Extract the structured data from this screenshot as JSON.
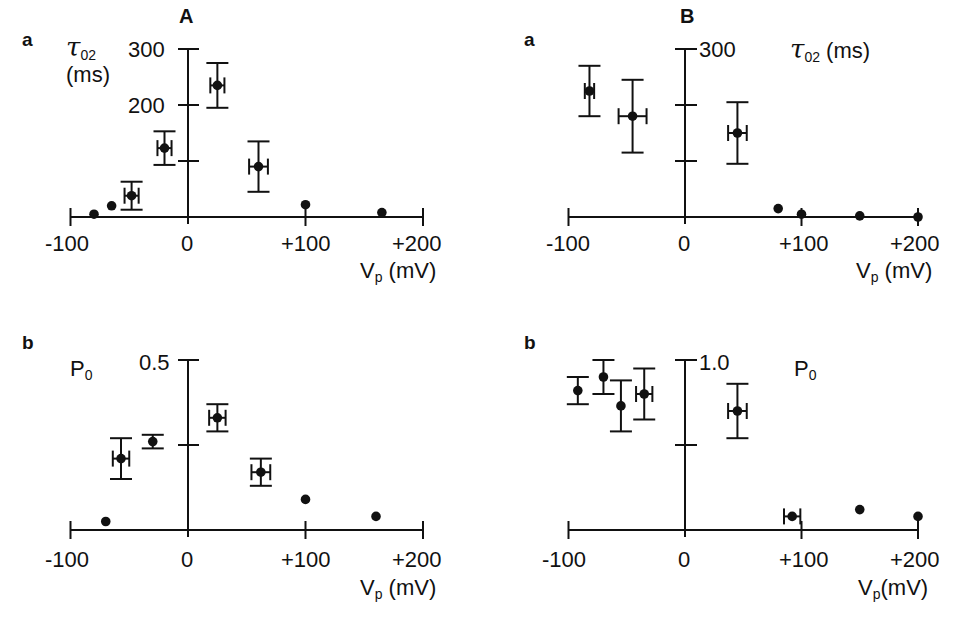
{
  "figure": {
    "panels": [
      "A",
      "B"
    ],
    "subpanels": [
      "a",
      "b"
    ]
  },
  "chart_data": [
    {
      "id": "A-a",
      "panel": "A",
      "subpanel": "a",
      "type": "scatter",
      "title": "A",
      "xlabel": "Vp (mV)",
      "ylabel": "τ02 (ms)",
      "xlim": [
        -100,
        200
      ],
      "ylim": [
        0,
        300
      ],
      "xticks": [
        "-100",
        "0",
        "+100",
        "+200"
      ],
      "yticks": [
        "100",
        "200",
        "300"
      ],
      "ytick_labels_shown": [
        "200",
        "300"
      ],
      "grid": false,
      "points": [
        {
          "x": -80,
          "y": 5
        },
        {
          "x": -65,
          "y": 20
        },
        {
          "x": -48,
          "y": 38,
          "yerr": 25,
          "xerr": 6
        },
        {
          "x": -20,
          "y": 123,
          "yerr": 30,
          "xerr": 6
        },
        {
          "x": 25,
          "y": 235,
          "yerr": 40,
          "xerr": 6
        },
        {
          "x": 60,
          "y": 90,
          "yerr": 45,
          "xerr": 8
        },
        {
          "x": 100,
          "y": 22
        },
        {
          "x": 165,
          "y": 8
        }
      ]
    },
    {
      "id": "B-a",
      "panel": "B",
      "subpanel": "a",
      "type": "scatter",
      "title": "B",
      "xlabel": "Vp (mV)",
      "ylabel": "τ02 (ms)",
      "xlim": [
        -100,
        200
      ],
      "ylim": [
        0,
        300
      ],
      "xticks": [
        "-100",
        "0",
        "+100",
        "+200"
      ],
      "yticks": [
        "100",
        "200",
        "300"
      ],
      "ytick_labels_shown": [
        "300"
      ],
      "grid": false,
      "points": [
        {
          "x": -82,
          "y": 225,
          "yerr": 45,
          "xerr": 4
        },
        {
          "x": -45,
          "y": 180,
          "yerr": 65,
          "xerr": 12
        },
        {
          "x": 45,
          "y": 150,
          "yerr": 55,
          "xerr": 8
        },
        {
          "x": 80,
          "y": 15
        },
        {
          "x": 100,
          "y": 5
        },
        {
          "x": 150,
          "y": 2
        },
        {
          "x": 200,
          "y": 0
        }
      ]
    },
    {
      "id": "A-b",
      "panel": "A",
      "subpanel": "b",
      "type": "scatter",
      "xlabel": "Vp (mV)",
      "ylabel": "P0",
      "xlim": [
        -100,
        200
      ],
      "ylim": [
        0,
        0.5
      ],
      "xticks": [
        "-100",
        "0",
        "+100",
        "+200"
      ],
      "yticks": [
        "0.25",
        "0.5"
      ],
      "ytick_labels_shown": [
        "0.5"
      ],
      "grid": false,
      "points": [
        {
          "x": -70,
          "y": 0.025
        },
        {
          "x": -57,
          "y": 0.21,
          "yerr": 0.06,
          "xerr": 7
        },
        {
          "x": -30,
          "y": 0.26,
          "yerr": 0.02,
          "xerr": 0
        },
        {
          "x": 25,
          "y": 0.33,
          "yerr": 0.04,
          "xerr": 7
        },
        {
          "x": 62,
          "y": 0.17,
          "yerr": 0.04,
          "xerr": 8
        },
        {
          "x": 100,
          "y": 0.09
        },
        {
          "x": 160,
          "y": 0.04
        }
      ]
    },
    {
      "id": "B-b",
      "panel": "B",
      "subpanel": "b",
      "type": "scatter",
      "xlabel": "Vp (mV)",
      "ylabel": "P0",
      "xlim": [
        -100,
        200
      ],
      "ylim": [
        0,
        1.0
      ],
      "xticks": [
        "-100",
        "0",
        "+100",
        "+200"
      ],
      "yticks": [
        "0.5",
        "1.0"
      ],
      "ytick_labels_shown": [
        "1.0"
      ],
      "grid": false,
      "points": [
        {
          "x": -92,
          "y": 0.82,
          "yerr": 0.08,
          "xerr": 0
        },
        {
          "x": -70,
          "y": 0.9,
          "yerr": 0.1,
          "xerr": 0
        },
        {
          "x": -55,
          "y": 0.73,
          "yerr": 0.15,
          "xerr": 0
        },
        {
          "x": -35,
          "y": 0.8,
          "yerr": 0.15,
          "xerr": 7
        },
        {
          "x": 45,
          "y": 0.7,
          "yerr": 0.16,
          "xerr": 8
        },
        {
          "x": 92,
          "y": 0.08,
          "xerr": 7
        },
        {
          "x": 150,
          "y": 0.12
        },
        {
          "x": 200,
          "y": 0.08
        }
      ]
    }
  ],
  "labels": {
    "panel_A": "A",
    "panel_B": "B",
    "sub_a": "a",
    "sub_b": "b",
    "tau_symbol": "τ",
    "tau_sub": "02",
    "ms_unit": "(ms)",
    "p_symbol": "P",
    "p_sub": "0",
    "v_symbol": "V",
    "v_sub": "p",
    "mv_unit": "(mV)",
    "x_tick_m100": "-100",
    "x_tick_0": "0",
    "x_tick_p100": "+100",
    "x_tick_p200": "+200",
    "y_tick_300": "300",
    "y_tick_200": "200",
    "y_tick_05": "0.5",
    "y_tick_10": "1.0"
  }
}
